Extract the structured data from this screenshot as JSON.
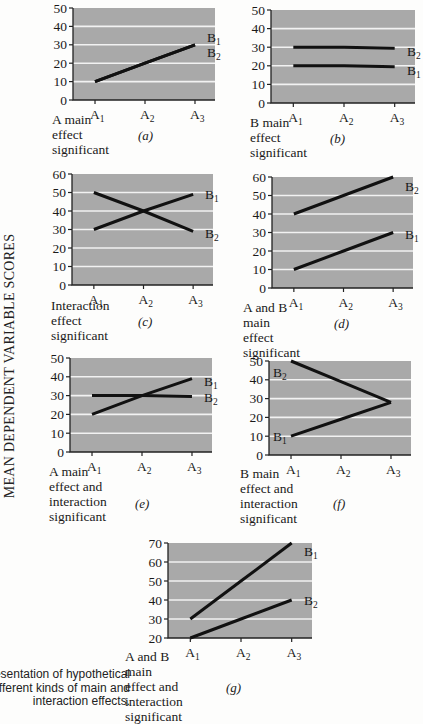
{
  "y_axis_label": "MEAN DEPENDENT VARIABLE SCORES",
  "figure_caption": "esentation of hypothetical\nfferent kinds of main and\ninteraction effects.",
  "colors": {
    "plot_bg": "#a9a9a9",
    "gridline": "#f2f2f2",
    "line": "#111111",
    "axis": "#222222"
  },
  "chart_data": [
    {
      "id": "a",
      "type": "line",
      "letter": "(a)",
      "title": "A main effect significant",
      "categories": [
        "A1",
        "A2",
        "A3"
      ],
      "ylim": [
        0,
        50
      ],
      "yticks": [
        0,
        10,
        20,
        30,
        40,
        50
      ],
      "grid": true,
      "series": [
        {
          "name": "B1",
          "values": [
            10,
            20,
            30
          ]
        },
        {
          "name": "B2",
          "values": [
            10,
            20,
            30
          ]
        }
      ],
      "labels": [
        {
          "text": "B",
          "sub": "1",
          "x": 30,
          "y": 34
        },
        {
          "text": "B",
          "sub": "2",
          "x": 30,
          "y": 26
        }
      ]
    },
    {
      "id": "b",
      "type": "line",
      "letter": "(b)",
      "title": "B main effect significant",
      "categories": [
        "A1",
        "A2",
        "A3"
      ],
      "ylim": [
        0,
        50
      ],
      "yticks": [
        0,
        10,
        20,
        30,
        40,
        50
      ],
      "grid": true,
      "series": [
        {
          "name": "B1",
          "values": [
            20,
            20,
            19.5
          ]
        },
        {
          "name": "B2",
          "values": [
            30,
            30,
            29.5
          ]
        }
      ],
      "labels": [
        {
          "text": "B",
          "sub": "2",
          "x": 30,
          "y": 28
        },
        {
          "text": "B",
          "sub": "1",
          "x": 30,
          "y": 18
        }
      ]
    },
    {
      "id": "c",
      "type": "line",
      "letter": "(c)",
      "title": "Interaction effect significant",
      "categories": [
        "A1",
        "A2",
        "A3"
      ],
      "ylim": [
        0,
        60
      ],
      "yticks": [
        0,
        10,
        20,
        30,
        40,
        50,
        60
      ],
      "grid": true,
      "series": [
        {
          "name": "B1",
          "values": [
            30,
            40,
            49
          ]
        },
        {
          "name": "B2",
          "values": [
            50,
            40,
            29
          ]
        }
      ],
      "labels": [
        {
          "text": "B",
          "sub": "1",
          "x": 30,
          "y": 49
        },
        {
          "text": "B",
          "sub": "2",
          "x": 30,
          "y": 28
        }
      ]
    },
    {
      "id": "d",
      "type": "line",
      "letter": "(d)",
      "title": "A and B main effect significant",
      "categories": [
        "A1",
        "A2",
        "A3"
      ],
      "ylim": [
        0,
        60
      ],
      "yticks": [
        0,
        10,
        20,
        30,
        40,
        50,
        60
      ],
      "grid": true,
      "series": [
        {
          "name": "B1",
          "values": [
            10,
            20,
            30
          ]
        },
        {
          "name": "B2",
          "values": [
            40,
            50,
            60
          ]
        }
      ],
      "labels": [
        {
          "text": "B",
          "sub": "2",
          "x": 30,
          "y": 55
        },
        {
          "text": "B",
          "sub": "1",
          "x": 30,
          "y": 29
        }
      ]
    },
    {
      "id": "e",
      "type": "line",
      "letter": "(e)",
      "title": "A main effect and interaction\nsignificant",
      "categories": [
        "A1",
        "A2",
        "A3"
      ],
      "ylim": [
        0,
        50
      ],
      "yticks": [
        0,
        10,
        20,
        30,
        40,
        50
      ],
      "grid": true,
      "series": [
        {
          "name": "B1",
          "values": [
            20,
            30,
            39
          ]
        },
        {
          "name": "B2",
          "values": [
            30,
            30,
            29.5
          ]
        }
      ],
      "labels": [
        {
          "text": "B",
          "sub": "1",
          "x": 30,
          "y": 38
        },
        {
          "text": "B",
          "sub": "2",
          "x": 30,
          "y": 29
        }
      ]
    },
    {
      "id": "f",
      "type": "line",
      "letter": "(f)",
      "title": "B main effect and interaction\nsignificant",
      "categories": [
        "A1",
        "A2",
        "A3"
      ],
      "ylim": [
        0,
        50
      ],
      "yticks": [
        0,
        10,
        20,
        30,
        40,
        50
      ],
      "grid": true,
      "series": [
        {
          "name": "B1",
          "values": [
            10,
            19,
            28
          ]
        },
        {
          "name": "B2",
          "values": [
            50,
            39,
            28
          ]
        }
      ],
      "labels": [
        {
          "text": "B",
          "sub": "2",
          "x": 8,
          "y": 44
        },
        {
          "text": "B",
          "sub": "1",
          "x": 8,
          "y": 10
        }
      ]
    },
    {
      "id": "g",
      "type": "line",
      "letter": "(g)",
      "title": "A and B main effect and\ninteraction significant",
      "categories": [
        "A1",
        "A2",
        "A3"
      ],
      "ylim": [
        20,
        70
      ],
      "yticks": [
        20,
        30,
        40,
        50,
        60,
        70
      ],
      "grid": true,
      "series": [
        {
          "name": "B1",
          "values": [
            30,
            50,
            70
          ]
        },
        {
          "name": "B2",
          "values": [
            20,
            30,
            40
          ]
        }
      ],
      "labels": [
        {
          "text": "B",
          "sub": "1",
          "x": 30,
          "y": 66
        },
        {
          "text": "B",
          "sub": "2",
          "x": 30,
          "y": 40
        }
      ]
    }
  ],
  "layout": [
    {
      "id": "a",
      "px": 73,
      "py": 8,
      "pw": 142,
      "ph": 92,
      "cap_y": 124,
      "let_x": 138,
      "let_y": 140
    },
    {
      "id": "b",
      "px": 271,
      "py": 10,
      "pw": 144,
      "ph": 93,
      "cap_y": 127,
      "let_x": 330,
      "let_y": 143
    },
    {
      "id": "c",
      "px": 72,
      "py": 174,
      "pw": 141,
      "ph": 111,
      "cap_y": 310,
      "let_x": 138,
      "let_y": 326
    },
    {
      "id": "d",
      "px": 272,
      "py": 177,
      "pw": 141,
      "ph": 111,
      "cap_y": 312,
      "let_x": 334,
      "let_y": 328
    },
    {
      "id": "e",
      "px": 70,
      "py": 358,
      "pw": 142,
      "ph": 94,
      "cap_y": 476,
      "let_x": 135,
      "let_y": 508
    },
    {
      "id": "f",
      "px": 269,
      "py": 361,
      "pw": 142,
      "ph": 94,
      "cap_y": 478,
      "let_x": 333,
      "let_y": 508
    },
    {
      "id": "g",
      "px": 168,
      "py": 543,
      "pw": 144,
      "ph": 95,
      "cap_y": 661,
      "let_x": 226,
      "let_y": 692
    }
  ]
}
